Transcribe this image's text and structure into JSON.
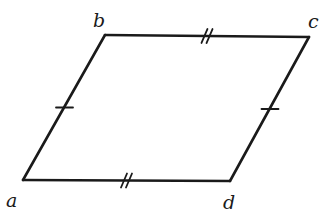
{
  "diagram": {
    "type": "parallelogram",
    "stroke_color": "#1a1a1a",
    "background": "#ffffff",
    "vertices": [
      {
        "name": "a",
        "x": 23,
        "y": 180,
        "label_x": 6,
        "label_y": 207
      },
      {
        "name": "b",
        "x": 105,
        "y": 35,
        "label_x": 93,
        "label_y": 27
      },
      {
        "name": "c",
        "x": 309,
        "y": 37,
        "label_x": 308,
        "label_y": 28
      },
      {
        "name": "d",
        "x": 230,
        "y": 181,
        "label_x": 223,
        "label_y": 209
      }
    ],
    "edges": [
      {
        "from": "a",
        "to": "b",
        "tick_marks": 1
      },
      {
        "from": "b",
        "to": "c",
        "tick_marks": 2
      },
      {
        "from": "c",
        "to": "d",
        "tick_marks": 1
      },
      {
        "from": "d",
        "to": "a",
        "tick_marks": 2
      }
    ]
  }
}
